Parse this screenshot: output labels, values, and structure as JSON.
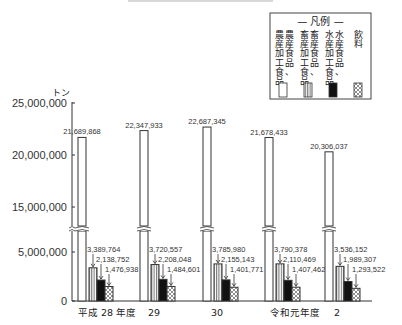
{
  "chart_data": {
    "type": "bar",
    "title": "",
    "xlabel": "",
    "ylabel": "トン",
    "ylim": [
      0,
      25000000
    ],
    "axis_break": [
      5000000,
      15000000
    ],
    "yticks": [
      "25,000,000",
      "20,000,000",
      "15,000,000",
      "5,000,000",
      "0"
    ],
    "categories": [
      "平成 28 年度",
      "29",
      "30",
      "令和元年度",
      "2"
    ],
    "series": [
      {
        "name": "農産食品、農産加工食品",
        "pattern": "white",
        "values": [
          21689868,
          22347933,
          22687345,
          21678433,
          20306037
        ],
        "labels": [
          "21,689,868",
          "22,347,933",
          "22,687,345",
          "21,678,433",
          "20,306,037"
        ]
      },
      {
        "name": "畜産食品、畜産加工食品",
        "pattern": "vertical-stripes",
        "values": [
          3389764,
          3720557,
          3785980,
          3790378,
          3536152
        ],
        "labels": [
          "3,389,764",
          "3,720,557",
          "3,785,980",
          "3,790,378",
          "3,536,152"
        ]
      },
      {
        "name": "水産食品、水産加工食品",
        "pattern": "black",
        "values": [
          2138752,
          2208048,
          2155143,
          2110469,
          1989307
        ],
        "labels": [
          "2,138,752",
          "2,208,048",
          "2,155,143",
          "2,110,469",
          "1,989,307"
        ]
      },
      {
        "name": "飲料",
        "pattern": "crosshatch",
        "values": [
          1476938,
          1484601,
          1401771,
          1407462,
          1293522
        ],
        "labels": [
          "1,476,938",
          "1,484,601",
          "1,401,771",
          "1,407,462",
          "1,293,522"
        ]
      }
    ],
    "legend": {
      "title": "— 凡例 —",
      "position": "top-right",
      "entries": [
        {
          "col1": "農産加工食品",
          "col2": "農産食品、"
        },
        {
          "col1": "畜産加工食品",
          "col2": "畜産食品、"
        },
        {
          "col1": "水産加工食品",
          "col2": "水産食品、"
        },
        {
          "col1": "",
          "col2": "飲料"
        }
      ]
    },
    "grid": false
  }
}
